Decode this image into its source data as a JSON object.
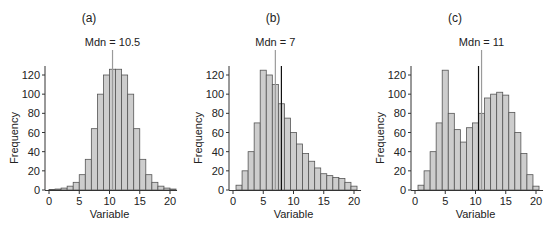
{
  "chart_data": [
    {
      "type": "bar",
      "panel_label": "(a)",
      "title": "",
      "xlabel": "Variable",
      "ylabel": "Frequency",
      "xlim": [
        0,
        21
      ],
      "ylim": [
        0,
        130
      ],
      "xticks": [
        0,
        5,
        10,
        15,
        20
      ],
      "yticks": [
        0,
        20,
        40,
        60,
        80,
        100,
        120
      ],
      "bins_center": [
        0.5,
        1.5,
        2.5,
        3.5,
        4.5,
        5.5,
        6.5,
        7.5,
        8.5,
        9.5,
        10.5,
        11.5,
        12.5,
        13.5,
        14.5,
        15.5,
        16.5,
        17.5,
        18.5,
        19.5,
        20.5
      ],
      "values": [
        0.5,
        1,
        2,
        4,
        8,
        16,
        32,
        64,
        100,
        120,
        126,
        126,
        120,
        100,
        64,
        32,
        16,
        8,
        4,
        2,
        1
      ],
      "median": 10.5,
      "median_label": "Mdn = 10.5",
      "mean": 10.5,
      "show_mean_line": false,
      "grid": false
    },
    {
      "type": "bar",
      "panel_label": "(b)",
      "title": "",
      "xlabel": "Variable",
      "ylabel": "Frequency",
      "xlim": [
        0,
        21
      ],
      "ylim": [
        0,
        130
      ],
      "xticks": [
        0,
        5,
        10,
        15,
        20
      ],
      "yticks": [
        0,
        20,
        40,
        60,
        80,
        100,
        120
      ],
      "bins_center": [
        1,
        2,
        3,
        4,
        5,
        6,
        7,
        8,
        9,
        10,
        11,
        12,
        13,
        14,
        15,
        16,
        17,
        18,
        19,
        20
      ],
      "values": [
        5,
        20,
        40,
        70,
        125,
        120,
        110,
        90,
        75,
        60,
        48,
        38,
        30,
        23,
        17,
        15,
        13,
        12,
        8,
        4
      ],
      "median": 7,
      "median_label": "Mdn = 7",
      "mean": 8,
      "show_mean_line": true,
      "grid": false
    },
    {
      "type": "bar",
      "panel_label": "(c)",
      "title": "",
      "xlabel": "Variable",
      "ylabel": "Frequency",
      "xlim": [
        0,
        21
      ],
      "ylim": [
        0,
        130
      ],
      "xticks": [
        0,
        5,
        10,
        15,
        20
      ],
      "yticks": [
        0,
        20,
        40,
        60,
        80,
        100,
        120
      ],
      "bins_center": [
        1,
        2,
        3,
        4,
        5,
        6,
        7,
        8,
        9,
        10,
        11,
        12,
        13,
        14,
        15,
        16,
        17,
        18,
        19,
        20
      ],
      "values": [
        5,
        20,
        40,
        70,
        125,
        80,
        63,
        50,
        65,
        70,
        80,
        96,
        100,
        102,
        99,
        81,
        60,
        38,
        16,
        4
      ],
      "median": 11,
      "median_label": "Mdn = 11",
      "mean": 10.5,
      "show_mean_line": true,
      "grid": false
    }
  ],
  "colors": {
    "bar_fill": "#cdcdcd",
    "bar_stroke": "#555555",
    "median_line": "#9a9a9a",
    "mean_line": "#111111",
    "axis": "#333333"
  }
}
